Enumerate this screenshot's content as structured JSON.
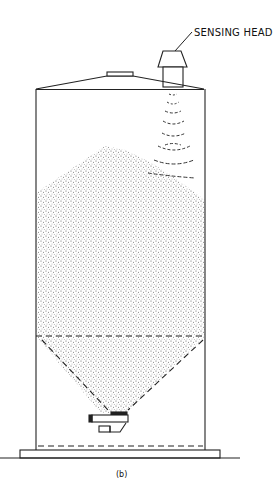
{
  "diagram": {
    "type": "silo-level-sensing",
    "labels": {
      "sensing_head": "SENSING HEAD",
      "caption": "(b)"
    },
    "components": [
      "sensing-head",
      "roof",
      "roof-hatch",
      "silo-wall",
      "bulk-material-pile",
      "conical-hopper",
      "discharge-feeder",
      "base-plate",
      "ground-line",
      "ultrasonic-waves"
    ],
    "colors": {
      "line": "#222222",
      "material_dots": "#555555",
      "background": "#ffffff"
    }
  }
}
